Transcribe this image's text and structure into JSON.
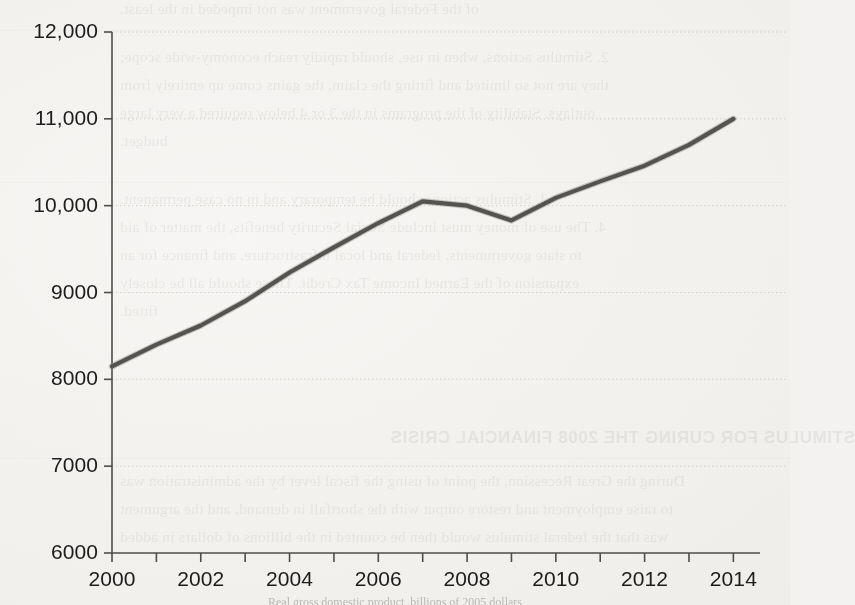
{
  "document": {
    "background_color": "#f3f2f0",
    "ink_color": "#2b2b2b",
    "bleed_through_text": [
      "of the Federal government was not impeded in the least.",
      "2. Stimulus actions, when in use, should rapidly reach economy-wide scope;",
      "they are not so limited and fitting the claim, the gains come up entirely from",
      "outlays. Stability of the programs in the 3 or 4 below required a very large",
      "budget.",
      "3. Stimulus actions should be temporary and in no case permanent.",
      "4. The use of money must include Social Security benefits, the matter of aid",
      "to state governments, federal and local infrastructure, and finance for an",
      "expansion of the Earned Income Tax Credit. These should all be closely",
      "fitted."
    ],
    "bleed_through_heading": "STIMULUS FOR CURING THE 2008 FINANCIAL CRISIS",
    "bleed_through_tail": [
      "During the Great Recession, the point of using the fiscal lever by the administration was",
      "to raise employment and restore output with the shortfall in demand, and the argument",
      "was that the federal stimulus would then be counted in the billions of dollars in added"
    ],
    "caption": "Real gross domestic product, billions of 2005 dollars"
  },
  "chart_data": {
    "type": "line",
    "title": "",
    "xlabel": "",
    "ylabel": "",
    "xlim": [
      2000,
      2014.6
    ],
    "ylim": [
      6000,
      12000
    ],
    "ytick_values": [
      6000,
      7000,
      8000,
      9000,
      10000,
      11000,
      12000
    ],
    "ytick_labels": [
      "6000",
      "7000",
      "8000",
      "9000",
      "10,000",
      "11,000",
      "12,000"
    ],
    "xtick_values": [
      2000,
      2001,
      2002,
      2003,
      2004,
      2005,
      2006,
      2007,
      2008,
      2009,
      2010,
      2011,
      2012,
      2013,
      2014
    ],
    "xtick_labels": [
      "2000",
      "",
      "2002",
      "",
      "2004",
      "",
      "2006",
      "",
      "2008",
      "",
      "2010",
      "",
      "2012",
      "",
      "2014"
    ],
    "grid": "horizontal-dashed-faint",
    "legend": "none",
    "line_color": "#555350",
    "line_width": 4.2,
    "x": [
      2000,
      2001,
      2002,
      2003,
      2004,
      2005,
      2006,
      2007,
      2008,
      2009,
      2010,
      2011,
      2012,
      2013,
      2014
    ],
    "values": [
      8150,
      8400,
      8620,
      8900,
      9230,
      9520,
      9800,
      10050,
      10000,
      9830,
      10090,
      10280,
      10460,
      10700,
      11000
    ],
    "series": [
      {
        "name": "Real GDP",
        "values": [
          8150,
          8400,
          8620,
          8900,
          9230,
          9520,
          9800,
          10050,
          10000,
          9830,
          10090,
          10280,
          10460,
          10700,
          11000
        ]
      }
    ],
    "annotations": {
      "peak_year": 2007,
      "peak_value": 10050,
      "trough_year": 2009,
      "trough_value": 9830,
      "start_value": 8150,
      "end_value": 11000
    }
  }
}
